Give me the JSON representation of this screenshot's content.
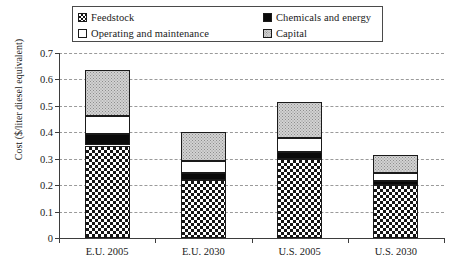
{
  "legend": {
    "entries": [
      {
        "label": "Feedstock",
        "swatch": "feedstock-swatch-icon"
      },
      {
        "label": "Chemicals and energy",
        "swatch": "chemicals-swatch-icon"
      },
      {
        "label": "Operating and maintenance",
        "swatch": "operating-swatch-icon"
      },
      {
        "label": "Capital",
        "swatch": "capital-swatch-icon"
      }
    ]
  },
  "axis": {
    "y_title": "Cost ($/liter diesel equivalent)",
    "y_ticks": [
      "0.7",
      "0.6",
      "0.5",
      "0.4",
      "0.3",
      "0.2",
      "0.1",
      "0"
    ]
  },
  "chart_data": {
    "type": "bar",
    "subtype": "stacked-vertical",
    "title": "",
    "xlabel": "",
    "ylabel": "Cost ($/liter diesel equivalent)",
    "ylim": [
      0,
      0.7
    ],
    "ytick_step": 0.1,
    "grid": true,
    "legend_position": "top",
    "categories": [
      "E.U. 2005",
      "E.U. 2030",
      "U.S. 2005",
      "U.S. 2030"
    ],
    "series": [
      {
        "name": "Feedstock",
        "values": [
          0.35,
          0.22,
          0.3,
          0.2
        ],
        "fill": "checkerboard"
      },
      {
        "name": "Chemicals and energy",
        "values": [
          0.045,
          0.025,
          0.025,
          0.015
        ],
        "fill": "solid-black"
      },
      {
        "name": "Operating and maintenance",
        "values": [
          0.065,
          0.045,
          0.055,
          0.03
        ],
        "fill": "white"
      },
      {
        "name": "Capital",
        "values": [
          0.175,
          0.11,
          0.135,
          0.07
        ],
        "fill": "light-stipple"
      }
    ],
    "totals": [
      0.635,
      0.4,
      0.515,
      0.315
    ]
  }
}
